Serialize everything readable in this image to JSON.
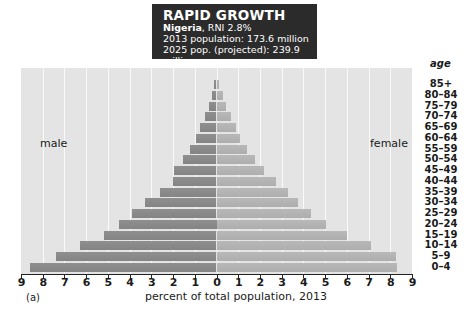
{
  "title_box": {
    "heading": "RAPID GROWTH",
    "country": "Nigeria",
    "rni": ", RNI 2.8%",
    "line2": "2013 population: 173.6 million",
    "line3": "2025 pop. (projected): 239.9 million"
  },
  "labels": {
    "male": "male",
    "female": "female",
    "age_header": "age",
    "xlabel": "percent of total population, 2013",
    "panel": "(a)"
  },
  "chart_data": {
    "type": "bar",
    "orientation": "horizontal",
    "subtype": "population-pyramid",
    "subtitle": [
      "2013 population: 173.6 million",
      "2025 pop. (projected): 239.9 million"
    ],
    "xlabel": "percent of total population, 2013",
    "ylabel": "age",
    "xlim": [
      -9,
      9
    ],
    "x_ticks": [
      "9",
      "8",
      "7",
      "6",
      "5",
      "4",
      "3",
      "2",
      "1",
      "0",
      "1",
      "2",
      "3",
      "4",
      "5",
      "6",
      "7",
      "8",
      "9"
    ],
    "grid": true,
    "categories": [
      "85+",
      "80–84",
      "75–79",
      "70–74",
      "65–69",
      "60–64",
      "55–59",
      "50–54",
      "45–49",
      "40–44",
      "35–39",
      "30–34",
      "25–29",
      "20–24",
      "15–19",
      "10–14",
      "5–9",
      "0–4"
    ],
    "series": [
      {
        "name": "male",
        "color": "#8a8a8a",
        "values": [
          0.1,
          0.2,
          0.35,
          0.55,
          0.75,
          0.95,
          1.2,
          1.55,
          1.95,
          2.0,
          2.6,
          3.3,
          3.9,
          4.5,
          5.2,
          6.3,
          7.4,
          8.6
        ]
      },
      {
        "name": "female",
        "color": "#b3b3b3",
        "values": [
          0.12,
          0.28,
          0.45,
          0.68,
          0.9,
          1.1,
          1.42,
          1.76,
          2.18,
          2.72,
          3.29,
          3.75,
          4.35,
          5.05,
          6.03,
          7.1,
          8.26,
          8.3
        ]
      }
    ],
    "annotations": [
      "male",
      "female",
      "(a)"
    ]
  }
}
